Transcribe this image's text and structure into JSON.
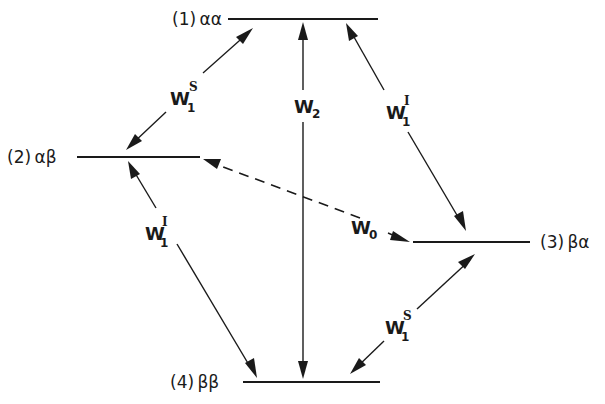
{
  "diagram": {
    "levels": [
      {
        "id": "1",
        "label": "(1) αα"
      },
      {
        "id": "2",
        "label": "(2) αβ"
      },
      {
        "id": "3",
        "label": "(3) βα"
      },
      {
        "id": "4",
        "label": "(4) ββ"
      }
    ],
    "transitions": [
      {
        "id": "w1s-12",
        "from": "1",
        "to": "2",
        "symbol": "W",
        "subscript": "1",
        "superscript": "S",
        "style": "solid",
        "direction": "both"
      },
      {
        "id": "w2-14",
        "from": "1",
        "to": "4",
        "symbol": "W",
        "subscript": "2",
        "superscript": "",
        "style": "solid",
        "direction": "both"
      },
      {
        "id": "w1i-13",
        "from": "1",
        "to": "3",
        "symbol": "W",
        "subscript": "1",
        "superscript": "I",
        "style": "solid",
        "direction": "both"
      },
      {
        "id": "w1i-24",
        "from": "2",
        "to": "4",
        "symbol": "W",
        "subscript": "1",
        "superscript": "I",
        "style": "solid",
        "direction": "both"
      },
      {
        "id": "w0-23",
        "from": "2",
        "to": "3",
        "symbol": "W",
        "subscript": "0",
        "superscript": "",
        "style": "dashed",
        "direction": "both"
      },
      {
        "id": "w1s-34",
        "from": "3",
        "to": "4",
        "symbol": "W",
        "subscript": "1",
        "superscript": "S",
        "style": "solid",
        "direction": "both"
      }
    ]
  }
}
